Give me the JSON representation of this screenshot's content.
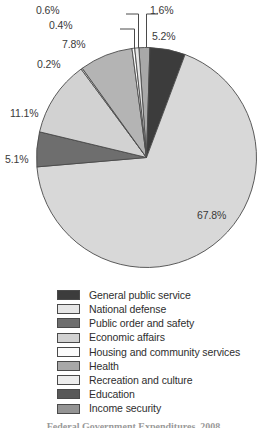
{
  "chart_data": {
    "type": "pie",
    "title": "",
    "subtitle": "",
    "xlabel": "",
    "ylabel": "",
    "legend_position": "bottom",
    "grid": false,
    "units": "percent",
    "start_angle_deg": -4,
    "direction": "clockwise",
    "categories": [
      "General public service",
      "National defense",
      "Public order and safety",
      "Economic affairs",
      "Housing and community services",
      "Health",
      "Recreation and culture",
      "Education",
      "Income security"
    ],
    "values": [
      5.2,
      0.6,
      5.1,
      11.1,
      0.4,
      1.6,
      0.2,
      7.8,
      67.8
    ],
    "colors": [
      "#3c3c3c",
      "#e6e6e6",
      "#6e6e6e",
      "#d2d2d2",
      "#fafafa",
      "#a8a8a8",
      "#ededed",
      "#585858",
      "#949494"
    ],
    "slices": [
      {
        "label": "Health",
        "value": 1.6,
        "display": "1.6%",
        "color": "#a8a8a8"
      },
      {
        "label": "General public service",
        "value": 5.2,
        "display": "5.2%",
        "color": "#3c3c3c"
      },
      {
        "label": "Income security",
        "value": 67.8,
        "display": "67.8%",
        "color": "#d8d8d8"
      },
      {
        "label": "Public order and safety",
        "value": 5.1,
        "display": "5.1%",
        "color": "#6e6e6e"
      },
      {
        "label": "Economic affairs",
        "value": 11.1,
        "display": "11.1%",
        "color": "#d2d2d2"
      },
      {
        "label": "Recreation and culture",
        "value": 0.2,
        "display": "0.2%",
        "color": "#f2f2f2"
      },
      {
        "label": "Education",
        "value": 7.8,
        "display": "7.8%",
        "color": "#b4b4b4"
      },
      {
        "label": "Housing and community services",
        "value": 0.4,
        "display": "0.4%",
        "color": "#fcfcfc"
      },
      {
        "label": "National defense",
        "value": 0.6,
        "display": "0.6%",
        "color": "#e6e6e6"
      }
    ],
    "data_labels": [
      {
        "text": "0.6%",
        "x": 36,
        "y": 4,
        "leader": true
      },
      {
        "text": "1.6%",
        "x": 150,
        "y": 4,
        "leader": true
      },
      {
        "text": "0.4%",
        "x": 49,
        "y": 19,
        "leader": true
      },
      {
        "text": "5.2%",
        "x": 152,
        "y": 30,
        "leader": false
      },
      {
        "text": "7.8%",
        "x": 62,
        "y": 38,
        "leader": false
      },
      {
        "text": "0.2%",
        "x": 37,
        "y": 58,
        "leader": false
      },
      {
        "text": "11.1%",
        "x": 10,
        "y": 107,
        "leader": false
      },
      {
        "text": "5.1%",
        "x": 5,
        "y": 153,
        "leader": false
      },
      {
        "text": "67.8%",
        "x": 197,
        "y": 209,
        "leader": false
      }
    ]
  },
  "legend": {
    "items": [
      {
        "label": "General public service",
        "color": "#3c3c3c"
      },
      {
        "label": "National defense",
        "color": "#e6e6e6"
      },
      {
        "label": "Public order and safety",
        "color": "#6e6e6e"
      },
      {
        "label": "Economic affairs",
        "color": "#d2d2d2"
      },
      {
        "label": "Housing and community services",
        "color": "#fbfbfb"
      },
      {
        "label": "Health",
        "color": "#a8a8a8"
      },
      {
        "label": "Recreation and culture",
        "color": "#ededed"
      },
      {
        "label": "Education",
        "color": "#585858"
      },
      {
        "label": "Income security",
        "color": "#949494"
      }
    ]
  },
  "caption": {
    "text": "Federal Government Expenditures, 2008"
  }
}
